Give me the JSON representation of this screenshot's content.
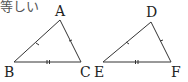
{
  "caption": "等しい",
  "triangles": [
    {
      "name": "ABC",
      "vertices": {
        "A": [
          60,
          20
        ],
        "B": [
          14,
          62
        ],
        "C": [
          81,
          62
        ]
      },
      "labels": {
        "A": "A",
        "B": "B",
        "C": "C"
      },
      "ticks": {
        "AB": 1,
        "AC": 1,
        "BC": 2
      }
    },
    {
      "name": "DEF",
      "vertices": {
        "D": [
          151,
          22
        ],
        "E": [
          103,
          62
        ],
        "F": [
          171,
          62
        ]
      },
      "labels": {
        "D": "D",
        "E": "E",
        "F": "F"
      },
      "ticks": {
        "DE": 1,
        "DF": 1,
        "EF": 2
      }
    }
  ],
  "colors": {
    "stroke": "#333333",
    "text": "#222222"
  }
}
